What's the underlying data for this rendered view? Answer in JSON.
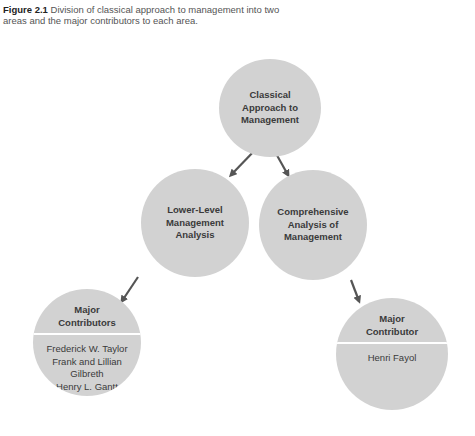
{
  "caption": {
    "figure_label": "Figure 2.1",
    "text": " Division of classical approach to management into two areas and the major contributors to each area."
  },
  "nodes": {
    "root": {
      "label": "Classical\nApproach to\nManagement"
    },
    "left": {
      "label": "Lower-Level\nManagement\nAnalysis"
    },
    "right": {
      "label": "Comprehensive\nAnalysis of\nManagement"
    },
    "left_contributors": {
      "header": "Major\nContributors",
      "names": "Frederick W. Taylor\nFrank and Lillian\nGilbreth\nHenry L. Gantt"
    },
    "right_contributors": {
      "header": "Major\nContributor",
      "names": "Henri Fayol"
    }
  },
  "colors": {
    "circle": "#d2d2d2",
    "arrow": "#555555",
    "text": "#3a3a3a"
  }
}
